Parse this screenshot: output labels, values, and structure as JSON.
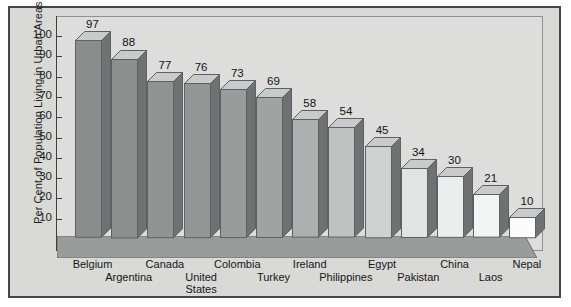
{
  "chart_data": {
    "type": "bar",
    "title": "",
    "subtitle": "",
    "xlabel": "",
    "ylabel": "Per Cent of Population Living in Urban Areas",
    "ylim": [
      0,
      105
    ],
    "yticks": [
      10,
      20,
      30,
      40,
      50,
      60,
      70,
      80,
      90,
      100
    ],
    "grid": false,
    "legend": false,
    "categories": [
      "Belgium",
      "Argentina",
      "Canada",
      "United States",
      "Colombia",
      "Turkey",
      "Ireland",
      "Philippines",
      "Egypt",
      "Pakistan",
      "China",
      "Laos",
      "Nepal"
    ],
    "category_lines": [
      [
        "Belgium"
      ],
      [
        "Argentina"
      ],
      [
        "Canada"
      ],
      [
        "United",
        "States"
      ],
      [
        "Colombia"
      ],
      [
        "Turkey"
      ],
      [
        "Ireland"
      ],
      [
        "Philippines"
      ],
      [
        "Egypt"
      ],
      [
        "Pakistan"
      ],
      [
        "China"
      ],
      [
        "Laos"
      ],
      [
        "Nepal"
      ]
    ],
    "values": [
      97,
      88,
      77,
      76,
      73,
      69,
      58,
      54,
      45,
      34,
      30,
      21,
      10
    ],
    "bar_face_colors": [
      "#8b8d8c",
      "#8d8f8e",
      "#919392",
      "#949695",
      "#9a9c9b",
      "#a1a3a2",
      "#aeb0af",
      "#c0c2c1",
      "#cfd1d0",
      "#e2e4e3",
      "#eceeed",
      "#f3f5f4",
      "#fafbfa"
    ],
    "bar_side_color": "#6f7271",
    "bar_top_color": "#c9cbca",
    "bar_outline_color": "#5d6064",
    "floor_color": "#9a9c9b",
    "plot_background": "#dddddb",
    "figure_background": "#d9d9d6",
    "frame_color": "#44474a",
    "axis_color": "#3c3f42",
    "text_color": "#14161a"
  }
}
